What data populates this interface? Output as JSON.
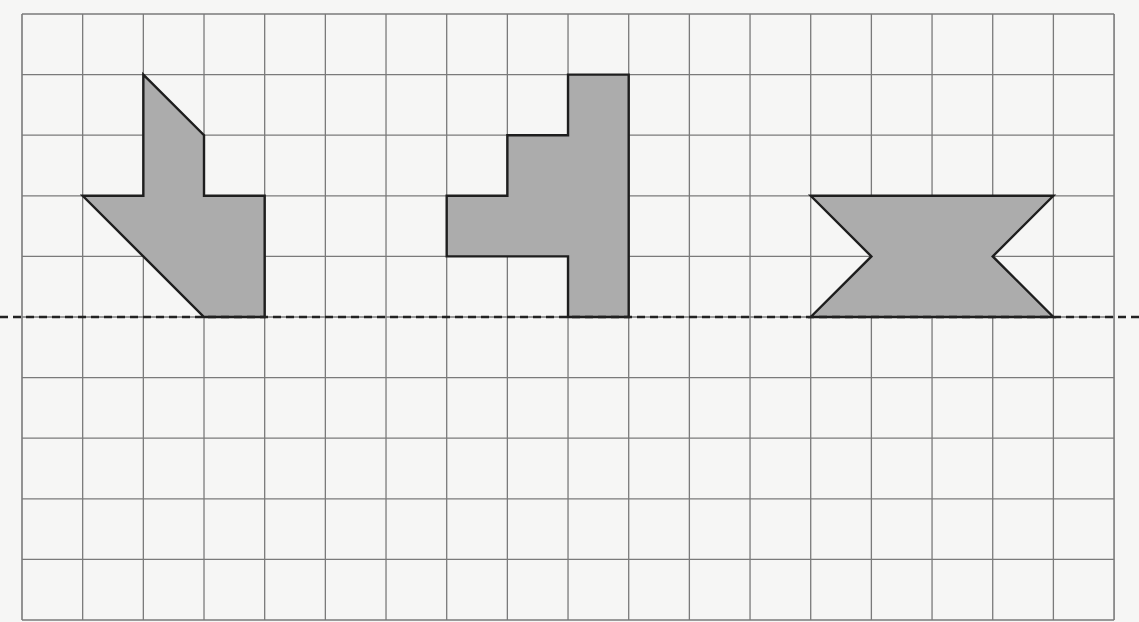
{
  "worksheet": {
    "type": "symmetry-grid",
    "grid": {
      "columns": 18,
      "rows": 10,
      "origin_x": 22,
      "origin_y": 14,
      "cell_width": 60.67,
      "cell_height": 60.6,
      "line_color": "#7a7a7a",
      "background": "#f6f6f5"
    },
    "axis": {
      "label": "line of symmetry",
      "style": "dashed",
      "row": 5,
      "color": "#222222"
    },
    "shape_style": {
      "fill": "#acacac",
      "stroke": "#1e1e1e"
    },
    "shapes": [
      {
        "name": "left-shape",
        "description": "arrow-like shape with diagonal edges",
        "points": [
          [
            2,
            1
          ],
          [
            3,
            2
          ],
          [
            3,
            3
          ],
          [
            4,
            3
          ],
          [
            4,
            5
          ],
          [
            3,
            5
          ],
          [
            1,
            3
          ],
          [
            2,
            3
          ]
        ]
      },
      {
        "name": "middle-shape",
        "description": "stepped staircase shape",
        "points": [
          [
            9,
            1
          ],
          [
            10,
            1
          ],
          [
            10,
            5
          ],
          [
            9,
            5
          ],
          [
            9,
            4
          ],
          [
            7,
            4
          ],
          [
            7,
            3
          ],
          [
            8,
            3
          ],
          [
            8,
            2
          ],
          [
            9,
            2
          ]
        ]
      },
      {
        "name": "right-shape",
        "description": "bow-tie / hourglass-notched rectangle",
        "points": [
          [
            13,
            3
          ],
          [
            17,
            3
          ],
          [
            16,
            4
          ],
          [
            17,
            5
          ],
          [
            13,
            5
          ],
          [
            14,
            4
          ]
        ]
      }
    ]
  }
}
